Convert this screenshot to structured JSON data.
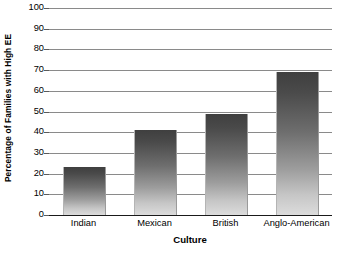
{
  "chart_data": {
    "type": "bar",
    "title": "",
    "subtitle": "",
    "xlabel": "Culture",
    "ylabel": "Percentage of Families with High EE",
    "categories": [
      "Indian",
      "Mexican",
      "British",
      "Anglo-American"
    ],
    "values": [
      23,
      41,
      49,
      69
    ],
    "series": [
      {
        "name": "Percentage of Families with High EE",
        "values": [
          23,
          41,
          49,
          69
        ]
      }
    ],
    "ylim": [
      0,
      100
    ],
    "xlim": [
      0,
      4
    ],
    "y_ticks": [
      0,
      10,
      20,
      30,
      40,
      50,
      60,
      70,
      80,
      90,
      100
    ],
    "y_tick_labels": [
      "0",
      "10",
      "20",
      "30",
      "40",
      "50",
      "60",
      "70",
      "80",
      "90",
      "100"
    ],
    "grid": true,
    "grid_axis": "y",
    "legend": false,
    "legend_position": "none",
    "annotations": [],
    "bar_fill": "#6e6e6e",
    "bar_fill_top": "#3f3f3f",
    "bar_fill_bottom": "#dcdcdc",
    "gridline_color": "#8a8a8a",
    "axis_color": "#1a1a1a",
    "background": "#ffffff"
  }
}
